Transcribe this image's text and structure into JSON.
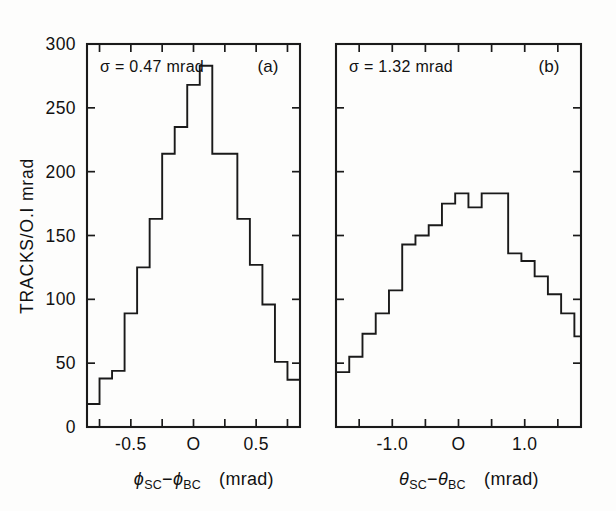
{
  "figure": {
    "background": "#fdfdfc",
    "ink_color": "#1a1a1a",
    "y_axis_label": "TRACKS/O.I mrad"
  },
  "chart_data": [
    {
      "type": "bar",
      "panel_tag": "(a)",
      "title": "",
      "annotation": "σ = 0.47 mrad",
      "xlabel_main": "ϕ",
      "xlabel_sub1": "SC",
      "xlabel_minus": "−",
      "xlabel_main2": "ϕ",
      "xlabel_sub2": "BC",
      "xlabel_units": "(mrad)",
      "ylabel": "TRACKS/O.I mrad",
      "xlim": [
        -0.85,
        0.85
      ],
      "ylim": [
        0,
        300
      ],
      "xticks": [
        -0.75,
        -0.5,
        -0.25,
        0,
        0.25,
        0.5,
        0.75
      ],
      "xticklabels": [
        "",
        "-0.5",
        "",
        "O",
        "",
        "0.5",
        ""
      ],
      "yticks": [
        0,
        50,
        100,
        150,
        200,
        250,
        300
      ],
      "yticklabels": [
        "0",
        "50",
        "100",
        "150",
        "200",
        "250",
        "300"
      ],
      "bin_width": 0.1,
      "bin_edges": [
        -0.85,
        -0.75,
        -0.65,
        -0.55,
        -0.45,
        -0.35,
        -0.25,
        -0.15,
        -0.05,
        0.05,
        0.15,
        0.25,
        0.35,
        0.45,
        0.55,
        0.65,
        0.75,
        0.85
      ],
      "values": [
        18,
        38,
        44,
        89,
        125,
        163,
        214,
        235,
        268,
        283,
        214,
        214,
        163,
        127,
        96,
        51,
        37,
        26
      ],
      "grid": false,
      "legend": "none"
    },
    {
      "type": "bar",
      "panel_tag": "(b)",
      "title": "",
      "annotation": "σ = 1.32 mrad",
      "xlabel_main": "θ",
      "xlabel_sub1": "SC",
      "xlabel_minus": "−",
      "xlabel_main2": "θ",
      "xlabel_sub2": "BC",
      "xlabel_units": "(mrad)",
      "ylabel": "TRACKS/O.I mrad",
      "xlim": [
        -1.85,
        1.85
      ],
      "ylim": [
        0,
        300
      ],
      "xticks": [
        -1.5,
        -1.0,
        -0.5,
        0,
        0.5,
        1.0,
        1.5
      ],
      "xticklabels": [
        "",
        "-1.0",
        "",
        "O",
        "",
        "1.0",
        ""
      ],
      "yticks": [
        0,
        50,
        100,
        150,
        200,
        250,
        300
      ],
      "yticklabels": [
        "",
        "",
        "",
        "",
        "",
        "",
        ""
      ],
      "bin_width": 0.2,
      "bin_edges": [
        -1.85,
        -1.65,
        -1.45,
        -1.25,
        -1.05,
        -0.85,
        -0.65,
        -0.45,
        -0.25,
        -0.05,
        0.15,
        0.35,
        0.55,
        0.75,
        0.95,
        1.15,
        1.35,
        1.55,
        1.75,
        1.85
      ],
      "values": [
        43,
        55,
        73,
        89,
        107,
        143,
        150,
        158,
        175,
        183,
        172,
        183,
        183,
        136,
        130,
        118,
        104,
        89,
        71,
        46
      ],
      "grid": false,
      "legend": "none"
    }
  ]
}
